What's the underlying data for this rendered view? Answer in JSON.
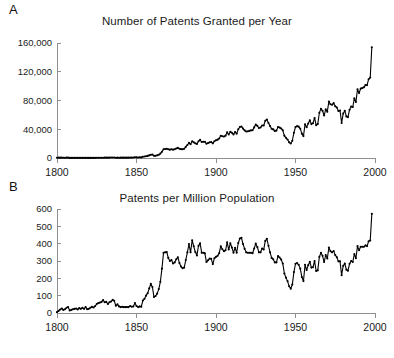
{
  "figure": {
    "panels": [
      {
        "label": "A"
      },
      {
        "label": "B"
      }
    ]
  },
  "chart_data": [
    {
      "type": "line",
      "panel_label": "A",
      "title": "Number of Patents Granted per Year",
      "xlabel": "",
      "ylabel": "",
      "xlim": [
        1800,
        2000
      ],
      "ylim": [
        0,
        160000
      ],
      "xticks": [
        1800,
        1850,
        1900,
        1950,
        2000
      ],
      "xticklabels": [
        "1800",
        "1850",
        "1900",
        "1950",
        "2000"
      ],
      "yticks": [
        0,
        40000,
        80000,
        120000,
        160000
      ],
      "yticklabels": [
        "0",
        "40,000",
        "80,000",
        "120,000",
        "160,000"
      ],
      "grid": false,
      "legend": null,
      "markers": "filled-circle",
      "x": [
        1800,
        1801,
        1802,
        1803,
        1804,
        1805,
        1806,
        1807,
        1808,
        1809,
        1810,
        1811,
        1812,
        1813,
        1814,
        1815,
        1816,
        1817,
        1818,
        1819,
        1820,
        1821,
        1822,
        1823,
        1824,
        1825,
        1826,
        1827,
        1828,
        1829,
        1830,
        1831,
        1832,
        1833,
        1834,
        1835,
        1836,
        1837,
        1838,
        1839,
        1840,
        1841,
        1842,
        1843,
        1844,
        1845,
        1846,
        1847,
        1848,
        1849,
        1850,
        1851,
        1852,
        1853,
        1854,
        1855,
        1856,
        1857,
        1858,
        1859,
        1860,
        1861,
        1862,
        1863,
        1864,
        1865,
        1866,
        1867,
        1868,
        1869,
        1870,
        1871,
        1872,
        1873,
        1874,
        1875,
        1876,
        1877,
        1878,
        1879,
        1880,
        1881,
        1882,
        1883,
        1884,
        1885,
        1886,
        1887,
        1888,
        1889,
        1890,
        1891,
        1892,
        1893,
        1894,
        1895,
        1896,
        1897,
        1898,
        1899,
        1900,
        1901,
        1902,
        1903,
        1904,
        1905,
        1906,
        1907,
        1908,
        1909,
        1910,
        1911,
        1912,
        1913,
        1914,
        1915,
        1916,
        1917,
        1918,
        1919,
        1920,
        1921,
        1922,
        1923,
        1924,
        1925,
        1926,
        1927,
        1928,
        1929,
        1930,
        1931,
        1932,
        1933,
        1934,
        1935,
        1936,
        1937,
        1938,
        1939,
        1940,
        1941,
        1942,
        1943,
        1944,
        1945,
        1946,
        1947,
        1948,
        1949,
        1950,
        1951,
        1952,
        1953,
        1954,
        1955,
        1956,
        1957,
        1958,
        1959,
        1960,
        1961,
        1962,
        1963,
        1964,
        1965,
        1966,
        1967,
        1968,
        1969,
        1970,
        1971,
        1972,
        1973,
        1974,
        1975,
        1976,
        1977,
        1978,
        1979,
        1980,
        1981,
        1982,
        1983,
        1984,
        1985,
        1986,
        1987,
        1988,
        1989,
        1990,
        1991,
        1992,
        1993,
        1994,
        1995,
        1996,
        1997,
        1998
      ],
      "y": [
        270,
        480,
        500,
        560,
        370,
        340,
        520,
        580,
        160,
        200,
        220,
        220,
        240,
        180,
        220,
        180,
        210,
        180,
        220,
        160,
        160,
        170,
        200,
        170,
        230,
        300,
        320,
        330,
        370,
        440,
        540,
        570,
        470,
        580,
        630,
        750,
        700,
        430,
        520,
        400,
        470,
        490,
        490,
        490,
        500,
        500,
        620,
        570,
        620,
        990,
        880,
        750,
        880,
        840,
        1750,
        2020,
        2500,
        2900,
        3700,
        4500,
        4800,
        3000,
        3200,
        3700,
        4600,
        6100,
        8800,
        12200,
        12500,
        12900,
        12100,
        11600,
        12200,
        11600,
        12200,
        13300,
        14100,
        12900,
        12300,
        12100,
        12900,
        15500,
        18100,
        21200,
        19100,
        23300,
        21800,
        20400,
        19600,
        23300,
        25300,
        22300,
        22600,
        22700,
        19800,
        20800,
        21800,
        22100,
        20400,
        23300,
        24600,
        25500,
        27100,
        31000,
        30200,
        29800,
        31100,
        35800,
        32700,
        36600,
        35100,
        32800,
        36100,
        33900,
        39900,
        43100,
        43900,
        40900,
        38500,
        36900,
        37100,
        37800,
        38400,
        38600,
        42600,
        46400,
        44700,
        41700,
        42400,
        45300,
        45200,
        51800,
        53500,
        48800,
        44400,
        40600,
        39800,
        37700,
        38100,
        43100,
        42300,
        41100,
        38500,
        31100,
        28100,
        25700,
        21800,
        20200,
        24000,
        35200,
        43100,
        44300,
        43600,
        40800,
        33900,
        30500,
        46800,
        42700,
        48000,
        52400,
        47200,
        48400,
        55700,
        45700,
        47400,
        62900,
        68400,
        65700,
        59100,
        67600,
        64400,
        78500,
        74800,
        74100,
        76300,
        72000,
        70200,
        65300,
        66100,
        48800,
        61800,
        65800,
        57900,
        56900,
        67200,
        71700,
        70900,
        82900,
        77900,
        95500,
        90400,
        96500,
        97400,
        98300,
        101400,
        101400,
        109600,
        111900,
        154000
      ]
    },
    {
      "type": "line",
      "panel_label": "B",
      "title": "Patents per Million Population",
      "xlabel": "",
      "ylabel": "",
      "xlim": [
        1800,
        2000
      ],
      "ylim": [
        0,
        600
      ],
      "xticks": [
        1800,
        1850,
        1900,
        1950,
        2000
      ],
      "xticklabels": [
        "1800",
        "1850",
        "1900",
        "1950",
        "2000"
      ],
      "yticks": [
        0,
        100,
        200,
        300,
        400,
        500,
        600
      ],
      "yticklabels": [
        "0",
        "100",
        "200",
        "300",
        "400",
        "500",
        "600"
      ],
      "grid": false,
      "legend": null,
      "markers": "filled-circle",
      "x": [
        1800,
        1801,
        1802,
        1803,
        1804,
        1805,
        1806,
        1807,
        1808,
        1809,
        1810,
        1811,
        1812,
        1813,
        1814,
        1815,
        1816,
        1817,
        1818,
        1819,
        1820,
        1821,
        1822,
        1823,
        1824,
        1825,
        1826,
        1827,
        1828,
        1829,
        1830,
        1831,
        1832,
        1833,
        1834,
        1835,
        1836,
        1837,
        1838,
        1839,
        1840,
        1841,
        1842,
        1843,
        1844,
        1845,
        1846,
        1847,
        1848,
        1849,
        1850,
        1851,
        1852,
        1853,
        1854,
        1855,
        1856,
        1857,
        1858,
        1859,
        1860,
        1861,
        1862,
        1863,
        1864,
        1865,
        1866,
        1867,
        1868,
        1869,
        1870,
        1871,
        1872,
        1873,
        1874,
        1875,
        1876,
        1877,
        1878,
        1879,
        1880,
        1881,
        1882,
        1883,
        1884,
        1885,
        1886,
        1887,
        1888,
        1889,
        1890,
        1891,
        1892,
        1893,
        1894,
        1895,
        1896,
        1897,
        1898,
        1899,
        1900,
        1901,
        1902,
        1903,
        1904,
        1905,
        1906,
        1907,
        1908,
        1909,
        1910,
        1911,
        1912,
        1913,
        1914,
        1915,
        1916,
        1917,
        1918,
        1919,
        1920,
        1921,
        1922,
        1923,
        1924,
        1925,
        1926,
        1927,
        1928,
        1929,
        1930,
        1931,
        1932,
        1933,
        1934,
        1935,
        1936,
        1937,
        1938,
        1939,
        1940,
        1941,
        1942,
        1943,
        1944,
        1945,
        1946,
        1947,
        1948,
        1949,
        1950,
        1951,
        1952,
        1953,
        1954,
        1955,
        1956,
        1957,
        1958,
        1959,
        1960,
        1961,
        1962,
        1963,
        1964,
        1965,
        1966,
        1967,
        1968,
        1969,
        1970,
        1971,
        1972,
        1973,
        1974,
        1975,
        1976,
        1977,
        1978,
        1979,
        1980,
        1981,
        1982,
        1983,
        1984,
        1985,
        1986,
        1987,
        1988,
        1989,
        1990,
        1991,
        1992,
        1993,
        1994,
        1995,
        1996,
        1997,
        1998
      ],
      "y": [
        5,
        12,
        20,
        26,
        18,
        22,
        30,
        34,
        14,
        18,
        22,
        24,
        26,
        20,
        28,
        24,
        30,
        24,
        34,
        22,
        24,
        30,
        36,
        32,
        40,
        52,
        58,
        60,
        64,
        74,
        62,
        64,
        52,
        62,
        66,
        76,
        70,
        42,
        50,
        38,
        34,
        36,
        34,
        34,
        34,
        34,
        40,
        36,
        38,
        58,
        40,
        34,
        38,
        36,
        72,
        82,
        100,
        114,
        142,
        168,
        150,
        92,
        98,
        112,
        138,
        180,
        256,
        348,
        350,
        352,
        318,
        300,
        306,
        286,
        292,
        310,
        322,
        288,
        268,
        258,
        262,
        306,
        350,
        398,
        350,
        420,
        385,
        352,
        332,
        388,
        402,
        348,
        348,
        344,
        294,
        304,
        314,
        312,
        282,
        316,
        324,
        330,
        345,
        385,
        368,
        356,
        362,
        408,
        366,
        402,
        378,
        348,
        376,
        348,
        404,
        430,
        434,
        398,
        370,
        350,
        348,
        348,
        348,
        345,
        372,
        400,
        380,
        350,
        350,
        372,
        366,
        416,
        428,
        388,
        350,
        318,
        310,
        292,
        292,
        328,
        320,
        308,
        286,
        228,
        204,
        184,
        154,
        140,
        164,
        236,
        284,
        288,
        278,
        256,
        208,
        184,
        278,
        248,
        276,
        296,
        262,
        264,
        300,
        242,
        246,
        324,
        348,
        330,
        294,
        334,
        314,
        378,
        356,
        350,
        358,
        334,
        322,
        298,
        298,
        218,
        272,
        286,
        250,
        244,
        284,
        300,
        294,
        340,
        316,
        386,
        362,
        382,
        382,
        382,
        390,
        386,
        414,
        418,
        572
      ]
    }
  ]
}
